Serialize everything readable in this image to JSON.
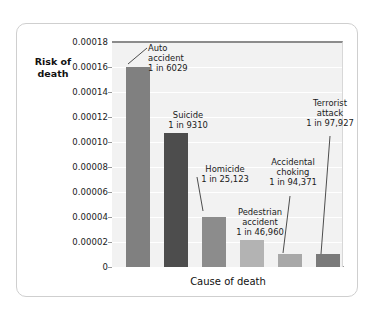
{
  "chart_data": {
    "type": "bar",
    "title": "",
    "xlabel": "Cause of death",
    "ylabel_line1": "Risk of",
    "ylabel_line2": "death",
    "ylim": [
      0,
      0.00018
    ],
    "grid": true,
    "legend": "none",
    "ytick_labels": [
      "0.00018",
      "0.00016",
      "0.00014",
      "0.00012",
      "0.00010",
      "0.00008",
      "0.00006",
      "0.00004",
      "0.00002",
      "0"
    ],
    "ytick_values": [
      0.00018,
      0.00016,
      0.00014,
      0.00012,
      0.0001,
      8e-05,
      6e-05,
      4e-05,
      2e-05,
      0
    ],
    "categories": [
      "Auto accident",
      "Suicide",
      "Homicide",
      "Pedestrian accident",
      "Accidental choking",
      "Terrorist attack"
    ],
    "values": [
      0.00016,
      0.0001074,
      3.98e-05,
      2.13e-05,
      1.06e-05,
      1.02e-05
    ],
    "odds_labels": [
      "1 in 6029",
      "1 in 9310",
      "1 in 25,123",
      "1 in 46,960",
      "1 in 94,371",
      "1 in 97,927"
    ],
    "bar_colors": [
      "#808080",
      "#4d4d4d",
      "#8c8c8c",
      "#b3b3b3",
      "#a8a8a8",
      "#7a7a7a"
    ],
    "annotations": [
      {
        "name": "Auto accident",
        "line1": "Auto",
        "line2": "accident",
        "line3": "1 in 6029"
      },
      {
        "name": "Suicide",
        "line1": "Suicide",
        "line2": "1 in 9310",
        "line3": ""
      },
      {
        "name": "Homicide",
        "line1": "Homicide",
        "line2": "1 in 25,123",
        "line3": ""
      },
      {
        "name": "Pedestrian accident",
        "line1": "Pedestrian",
        "line2": "accident",
        "line3": "1 in 46,960"
      },
      {
        "name": "Accidental choking",
        "line1": "Accidental",
        "line2": "choking",
        "line3": "1 in 94,371"
      },
      {
        "name": "Terrorist attack",
        "line1": "Terrorist",
        "line2": "attack",
        "line3": "1 in 97,927"
      }
    ],
    "colors": {
      "plot_background": "#f2f2f2",
      "gridline": "#ffffff",
      "axis": "#9a9a9a",
      "text": "#1a1a1a",
      "card_border": "#cfcfcf"
    }
  }
}
